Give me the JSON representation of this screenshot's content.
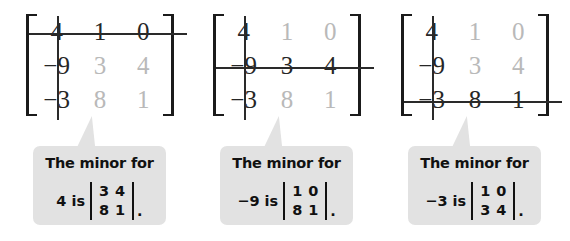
{
  "figure": {
    "background_color": "#ffffff",
    "bubble_color": "#e2e2e2",
    "struck_text_color": "#262626",
    "remaining_text_color": "#b9b9b9",
    "strike_color": "#2a2a2a"
  },
  "panels": [
    {
      "matrix": {
        "rows": [
          [
            "4",
            "1",
            "0"
          ],
          [
            "−9",
            "3",
            "4"
          ],
          [
            "−3",
            "8",
            "1"
          ]
        ],
        "struck_row": 1,
        "struck_col": 1,
        "cell_dark": [
          [
            true,
            true,
            true
          ],
          [
            true,
            false,
            false
          ],
          [
            true,
            false,
            false
          ]
        ]
      },
      "caption": {
        "line1": "The minor for",
        "entry": "4 is",
        "minor": [
          [
            "3",
            "4"
          ],
          [
            "8",
            "1"
          ]
        ],
        "period": "."
      }
    },
    {
      "matrix": {
        "rows": [
          [
            "4",
            "1",
            "0"
          ],
          [
            "−9",
            "3",
            "4"
          ],
          [
            "−3",
            "8",
            "1"
          ]
        ],
        "struck_row": 2,
        "struck_col": 1,
        "cell_dark": [
          [
            true,
            false,
            false
          ],
          [
            true,
            true,
            true
          ],
          [
            true,
            false,
            false
          ]
        ]
      },
      "caption": {
        "line1": "The minor for",
        "entry": "−9 is",
        "minor": [
          [
            "1",
            "0"
          ],
          [
            "8",
            "1"
          ]
        ],
        "period": "."
      }
    },
    {
      "matrix": {
        "rows": [
          [
            "4",
            "1",
            "0"
          ],
          [
            "−9",
            "3",
            "4"
          ],
          [
            "−3",
            "8",
            "1"
          ]
        ],
        "struck_row": 3,
        "struck_col": 1,
        "cell_dark": [
          [
            true,
            false,
            false
          ],
          [
            true,
            false,
            false
          ],
          [
            true,
            true,
            true
          ]
        ]
      },
      "caption": {
        "line1": "The minor for",
        "entry": "−3 is",
        "minor": [
          [
            "1",
            "0"
          ],
          [
            "3",
            "4"
          ]
        ],
        "period": "."
      }
    }
  ]
}
